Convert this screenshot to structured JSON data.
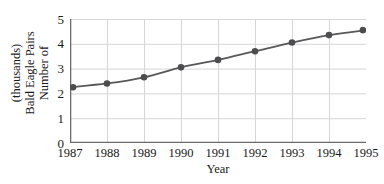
{
  "chart_data": {
    "type": "line",
    "title": "",
    "xlabel": "Year",
    "ylabel": "Number of Bald Eagle Pairs (thousands)",
    "ylabel_lines": [
      "Number of",
      "Bald Eagle Pairs",
      "(thousands)"
    ],
    "categories": [
      "1987",
      "1988",
      "1989",
      "1990",
      "1991",
      "1992",
      "1993",
      "1994",
      "1995"
    ],
    "x": [
      1987,
      1988,
      1989,
      1990,
      1991,
      1992,
      1993,
      1994,
      1995
    ],
    "values": [
      2.25,
      2.4,
      2.65,
      3.05,
      3.35,
      3.7,
      4.05,
      4.35,
      4.55
    ],
    "xtick_labels": [
      "1987",
      "1988",
      "1989",
      "1990",
      "1991",
      "1992",
      "1993",
      "1994",
      "1995"
    ],
    "ytick_labels": [
      "0",
      "1",
      "2",
      "3",
      "4",
      "5"
    ],
    "yticks": [
      0,
      1,
      2,
      3,
      4,
      5
    ],
    "ylim": [
      0,
      5
    ],
    "xlim": [
      1987,
      1995
    ],
    "grid": true,
    "legend": null,
    "series_color": "#58585a",
    "marker": "circle",
    "marker_color": "#4d4d4f",
    "grid_color": "#d6d6d6",
    "axis_color": "#6b6b6d"
  }
}
